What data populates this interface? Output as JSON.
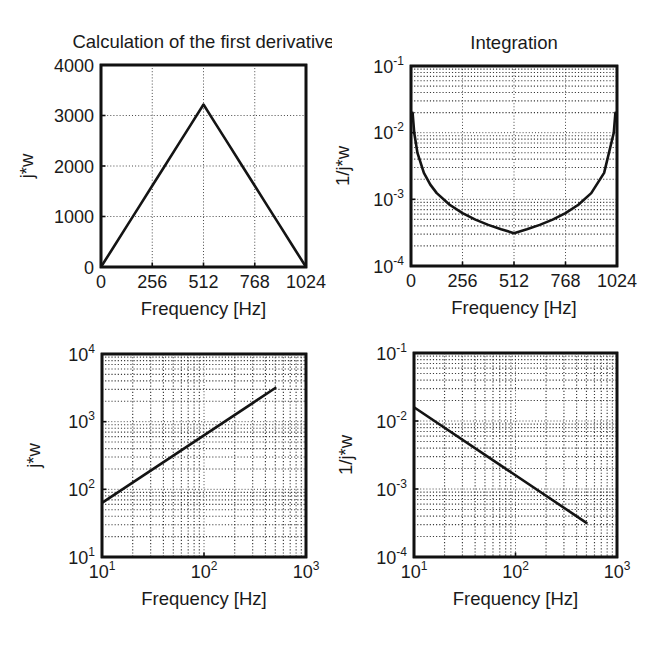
{
  "figure": {
    "width": 664,
    "height": 651,
    "background": "#ffffff",
    "line_color": "#141414",
    "grid_color": "#4a4a4a"
  },
  "chart_data": [
    {
      "id": "top-left",
      "type": "line",
      "title": "Calculation of the first derivative",
      "xlabel": "Frequency [Hz]",
      "ylabel": "j*w",
      "xscale": "linear",
      "yscale": "linear",
      "xlim": [
        0,
        1024
      ],
      "ylim": [
        0,
        4000
      ],
      "xticks": [
        0,
        256,
        512,
        768,
        1024
      ],
      "xticklabels": [
        "0",
        "256",
        "512",
        "768",
        "1024"
      ],
      "yticks": [
        0,
        1000,
        2000,
        3000,
        4000
      ],
      "yticklabels": [
        "0",
        "1000",
        "2000",
        "3000",
        "4000"
      ],
      "grid": true,
      "legend": null,
      "series": [
        {
          "name": "j*w",
          "x": [
            0,
            64,
            128,
            192,
            256,
            320,
            384,
            448,
            512,
            576,
            640,
            704,
            768,
            832,
            896,
            960,
            1024
          ],
          "y": [
            0,
            402,
            804,
            1206,
            1608,
            2011,
            2413,
            2815,
            3217,
            2815,
            2413,
            2011,
            1608,
            1206,
            804,
            402,
            0
          ]
        }
      ]
    },
    {
      "id": "top-right",
      "type": "line",
      "title": "Integration",
      "xlabel": "Frequency [Hz]",
      "ylabel": "1/j*w",
      "xscale": "linear",
      "yscale": "log",
      "xlim": [
        0,
        1024
      ],
      "ylim": [
        0.0001,
        0.1
      ],
      "xticks": [
        0,
        256,
        512,
        768,
        1024
      ],
      "xticklabels": [
        "0",
        "256",
        "512",
        "768",
        "1024"
      ],
      "yticks": [
        0.0001,
        0.001,
        0.01,
        0.1
      ],
      "yticklabels": [
        "10-4",
        "10-3",
        "10-2",
        "10-1"
      ],
      "ytick_mantissa": "10",
      "ytick_exponents": [
        "-4",
        "-3",
        "-2",
        "-1"
      ],
      "grid": true,
      "minor_grid": true,
      "legend": null,
      "series": [
        {
          "name": "1/j*w",
          "x": [
            8,
            16,
            32,
            64,
            96,
            128,
            192,
            256,
            320,
            384,
            448,
            512,
            576,
            640,
            704,
            768,
            832,
            896,
            960,
            1008,
            1016
          ],
          "y": [
            0.0199,
            0.00995,
            0.00497,
            0.00249,
            0.00166,
            0.00124,
            0.000829,
            0.000622,
            0.000497,
            0.000414,
            0.000355,
            0.000311,
            0.000355,
            0.000414,
            0.000497,
            0.000622,
            0.000829,
            0.00124,
            0.00249,
            0.00995,
            0.0199
          ]
        }
      ]
    },
    {
      "id": "bottom-left",
      "type": "line",
      "title": "",
      "xlabel": "Frequency [Hz]",
      "ylabel": "j*w",
      "xscale": "log",
      "yscale": "log",
      "xlim": [
        10,
        1000
      ],
      "ylim": [
        10,
        10000
      ],
      "xticks": [
        10,
        100,
        1000
      ],
      "xtick_mantissa": "10",
      "xtick_exponents": [
        "1",
        "2",
        "3"
      ],
      "yticks": [
        10,
        100,
        1000,
        10000
      ],
      "ytick_mantissa": "10",
      "ytick_exponents": [
        "1",
        "2",
        "3",
        "4"
      ],
      "grid": true,
      "minor_grid": true,
      "legend": null,
      "series": [
        {
          "name": "j*w",
          "x": [
            10,
            500
          ],
          "y": [
            63,
            3140
          ]
        }
      ]
    },
    {
      "id": "bottom-right",
      "type": "line",
      "title": "",
      "xlabel": "Frequency [Hz]",
      "ylabel": "1/j*w",
      "xscale": "log",
      "yscale": "log",
      "xlim": [
        10,
        1000
      ],
      "ylim": [
        0.0001,
        0.1
      ],
      "xticks": [
        10,
        100,
        1000
      ],
      "xtick_mantissa": "10",
      "xtick_exponents": [
        "1",
        "2",
        "3"
      ],
      "yticks": [
        0.0001,
        0.001,
        0.01,
        0.1
      ],
      "ytick_mantissa": "10",
      "ytick_exponents": [
        "-4",
        "-3",
        "-2",
        "-1"
      ],
      "grid": true,
      "minor_grid": true,
      "legend": null,
      "series": [
        {
          "name": "1/j*w",
          "x": [
            10,
            500
          ],
          "y": [
            0.0159,
            0.000318
          ]
        }
      ]
    }
  ]
}
